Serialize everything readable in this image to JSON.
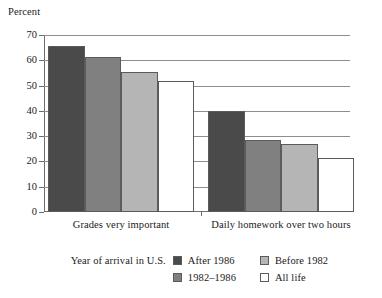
{
  "chart_data": {
    "type": "bar",
    "title": "",
    "xlabel": "",
    "ylabel": "Percent",
    "ylim": [
      0,
      70
    ],
    "yticks": [
      0,
      10,
      20,
      30,
      40,
      50,
      60,
      70
    ],
    "grid": true,
    "legend_position": "bottom",
    "legend_caption": "Year of arrival in U.S.",
    "categories": [
      "Grades very important",
      "Daily homework over two hours"
    ],
    "series": [
      {
        "name": "After 1986",
        "color": "#4a4a4a",
        "values": [
          65.5,
          40.0
        ]
      },
      {
        "name": "1982–1986",
        "color": "#808080",
        "values": [
          61.5,
          28.5
        ]
      },
      {
        "name": "Before 1982",
        "color": "#b5b5b5",
        "values": [
          55.5,
          27.0
        ]
      },
      {
        "name": "All life",
        "color": "#ffffff",
        "values": [
          52.0,
          21.5
        ]
      }
    ]
  },
  "axis": {
    "y_title": "Percent",
    "y_tick_labels": [
      "0",
      "10",
      "20",
      "30",
      "40",
      "50",
      "60",
      "70"
    ]
  },
  "legend": {
    "caption": "Year of arrival in U.S.",
    "entries": [
      {
        "label": "After 1986",
        "color": "#4a4a4a"
      },
      {
        "label": "Before 1982",
        "color": "#b5b5b5"
      },
      {
        "label": "1982–1986",
        "color": "#808080"
      },
      {
        "label": "All life",
        "color": "#ffffff"
      }
    ]
  },
  "colors": {
    "after_1986": "#4a4a4a",
    "y_1982_1986": "#808080",
    "before_1982": "#b5b5b5",
    "all_life": "#ffffff",
    "axis": "#6d6d6d",
    "grid": "#8d8d8d",
    "bar_outline": "#5b5b5b"
  }
}
